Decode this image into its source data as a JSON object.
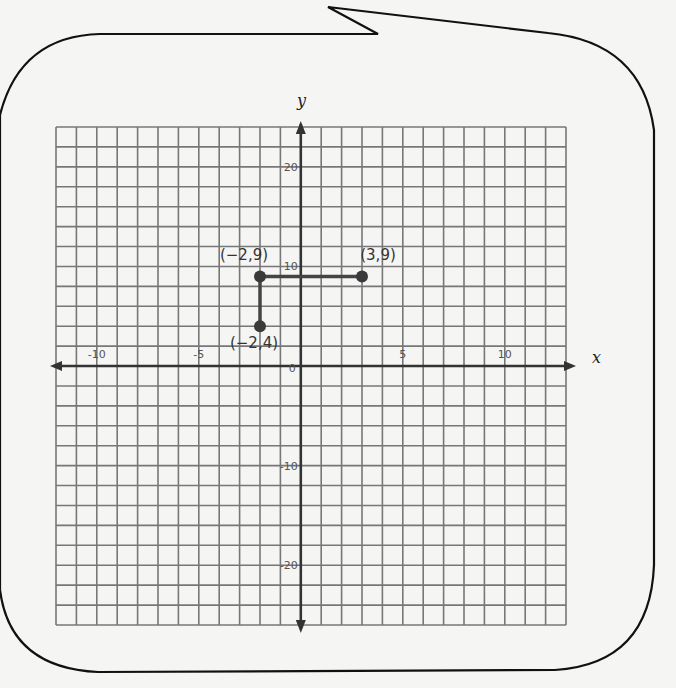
{
  "figure": {
    "container": "speech-bubble",
    "bubble_stroke": "#111111",
    "background": "#f5f5f3",
    "grid_color": "#777777",
    "axis_color": "#333333",
    "point_color": "#3a3a3a",
    "segment_color": "#444444"
  },
  "chart_data": {
    "type": "scatter",
    "title": "",
    "xlabel": "x",
    "ylabel": "y",
    "xlim": [
      -12,
      13
    ],
    "ylim": [
      -26,
      24
    ],
    "grid": true,
    "x_grid_step": 1,
    "y_grid_step": 2,
    "x_ticks": [
      {
        "value": -10,
        "label": "-10"
      },
      {
        "value": -5,
        "label": "-5"
      },
      {
        "value": 0,
        "label": "0"
      },
      {
        "value": 5,
        "label": "5"
      },
      {
        "value": 10,
        "label": "10"
      }
    ],
    "y_ticks": [
      {
        "value": 20,
        "label": "20"
      },
      {
        "value": 10,
        "label": "10"
      },
      {
        "value": -10,
        "label": "-10"
      },
      {
        "value": -20,
        "label": "-20"
      }
    ],
    "points": [
      {
        "x": -2,
        "y": 9,
        "label": "(−2,9)"
      },
      {
        "x": 3,
        "y": 9,
        "label": "(3,9)"
      },
      {
        "x": -2,
        "y": 4,
        "label": "(−2,4)"
      }
    ],
    "segments": [
      {
        "from": [
          -2,
          9
        ],
        "to": [
          3,
          9
        ]
      },
      {
        "from": [
          -2,
          9
        ],
        "to": [
          -2,
          4
        ]
      }
    ]
  }
}
